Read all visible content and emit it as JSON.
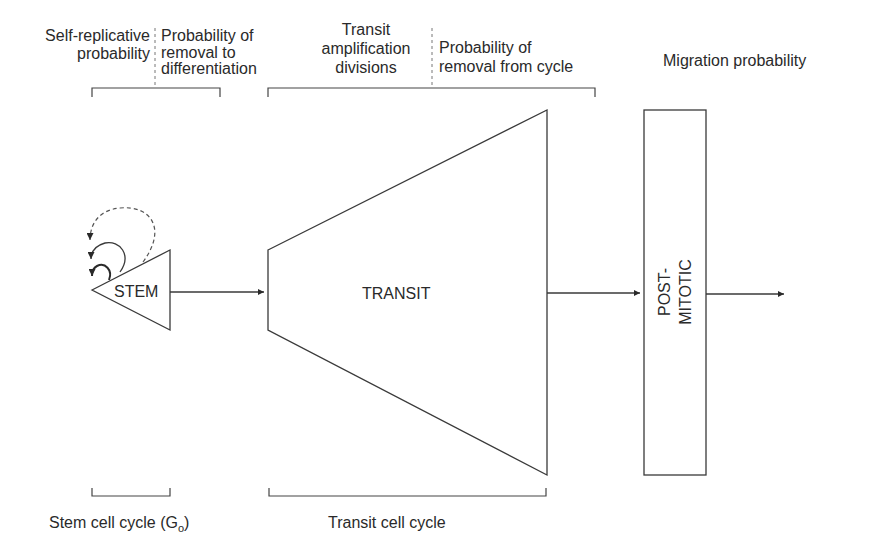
{
  "top_labels": {
    "self_replicative": [
      "Self-replicative",
      "probability"
    ],
    "removal_to_diff": [
      "Probability of",
      "removal to",
      "differentiation"
    ],
    "transit_amp": [
      "Transit",
      "amplification",
      "divisions"
    ],
    "removal_from_cycle": [
      "Probability of",
      "removal from cycle"
    ],
    "migration": "Migration probability"
  },
  "nodes": {
    "stem": "STEM",
    "transit": "TRANSIT",
    "postmitotic": [
      "POST-",
      "MITOTIC"
    ]
  },
  "bottom_labels": {
    "stem_cycle": "Stem cell cycle (G",
    "stem_cycle_sub": "o",
    "stem_cycle_close": ")",
    "transit_cycle": "Transit cell cycle"
  },
  "colors": {
    "stroke": "#3a3a3a",
    "text": "#2a2a2a",
    "background": "#ffffff"
  }
}
